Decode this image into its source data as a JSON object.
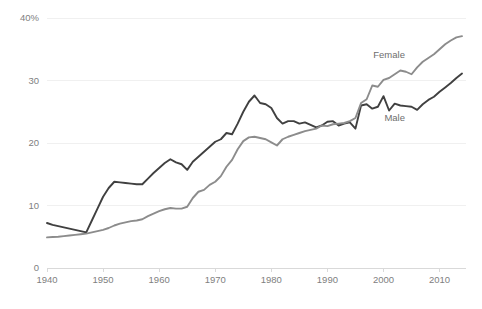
{
  "chart_data": {
    "type": "line",
    "title": "",
    "subtitle": "",
    "xlabel": "",
    "ylabel": "",
    "xlim": [
      1940,
      2014
    ],
    "ylim": [
      0,
      40
    ],
    "grid": true,
    "legend_position": "inline-annotation",
    "x_tick_labels": [
      "1940",
      "1950",
      "1960",
      "1970",
      "1980",
      "1990",
      "2000",
      "2010"
    ],
    "x_ticks": [
      1940,
      1950,
      1960,
      1970,
      1980,
      1990,
      2000,
      2010
    ],
    "y_tick_labels": [
      "0",
      "10",
      "20",
      "30",
      "40%"
    ],
    "y_ticks": [
      0,
      10,
      20,
      30,
      40
    ],
    "x": [
      1940,
      1941,
      1942,
      1943,
      1944,
      1945,
      1946,
      1947,
      1948,
      1949,
      1950,
      1951,
      1952,
      1953,
      1954,
      1955,
      1956,
      1957,
      1958,
      1959,
      1960,
      1961,
      1962,
      1963,
      1964,
      1965,
      1966,
      1967,
      1968,
      1969,
      1970,
      1971,
      1972,
      1973,
      1974,
      1975,
      1976,
      1977,
      1978,
      1979,
      1980,
      1981,
      1982,
      1983,
      1984,
      1985,
      1986,
      1987,
      1988,
      1989,
      1990,
      1991,
      1992,
      1993,
      1994,
      1995,
      1996,
      1997,
      1998,
      1999,
      2000,
      2001,
      2002,
      2003,
      2004,
      2005,
      2006,
      2007,
      2008,
      2009,
      2010,
      2011,
      2012,
      2013,
      2014
    ],
    "series": [
      {
        "name": "Male",
        "color": "#404040",
        "label_x": 2002,
        "label_y": 23.6,
        "values": [
          7.2,
          6.9,
          6.7,
          6.5,
          6.3,
          6.1,
          5.9,
          5.7,
          7.6,
          9.5,
          11.4,
          12.8,
          13.8,
          13.7,
          13.6,
          13.5,
          13.4,
          13.4,
          14.3,
          15.2,
          16.0,
          16.8,
          17.4,
          16.9,
          16.6,
          15.7,
          17.0,
          17.8,
          18.6,
          19.4,
          20.2,
          20.6,
          21.6,
          21.4,
          23.1,
          25.0,
          26.6,
          27.6,
          26.4,
          26.2,
          25.6,
          24.0,
          23.1,
          23.5,
          23.5,
          23.1,
          23.3,
          22.9,
          22.5,
          22.8,
          23.4,
          23.5,
          22.8,
          23.1,
          23.3,
          22.3,
          26.0,
          26.2,
          25.5,
          25.8,
          27.5,
          25.2,
          26.3,
          26.0,
          25.9,
          25.8,
          25.3,
          26.2,
          26.9,
          27.4,
          28.2,
          28.9,
          29.6,
          30.4,
          31.1
        ]
      },
      {
        "name": "Female",
        "color": "#8c8c8c",
        "label_x": 2001,
        "label_y": 33.6,
        "values": [
          4.9,
          4.95,
          5.0,
          5.1,
          5.2,
          5.3,
          5.4,
          5.5,
          5.7,
          5.9,
          6.1,
          6.4,
          6.8,
          7.1,
          7.3,
          7.5,
          7.6,
          7.8,
          8.3,
          8.7,
          9.1,
          9.4,
          9.6,
          9.5,
          9.5,
          9.8,
          11.2,
          12.2,
          12.5,
          13.3,
          13.8,
          14.7,
          16.2,
          17.3,
          19.0,
          20.3,
          20.9,
          21.0,
          20.8,
          20.6,
          20.1,
          19.6,
          20.6,
          21.0,
          21.3,
          21.6,
          21.9,
          22.1,
          22.3,
          22.8,
          22.7,
          23.0,
          23.1,
          23.2,
          23.5,
          24.0,
          26.4,
          27.0,
          29.2,
          29.0,
          30.1,
          30.4,
          31.0,
          31.6,
          31.4,
          31.0,
          32.1,
          33.0,
          33.6,
          34.2,
          35.0,
          35.8,
          36.4,
          36.9,
          37.1
        ]
      }
    ]
  }
}
